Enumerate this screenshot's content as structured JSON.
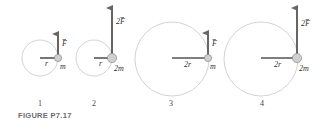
{
  "figure": {
    "caption": "FIGURE P7.17",
    "colors": {
      "circle": "#c8c8c8",
      "arrow": "#666666",
      "mass_fill": "#cfcfcf",
      "mass_stroke": "#8a8a8a",
      "radius_line": "#555555"
    },
    "panels": [
      {
        "number": "1",
        "radius_label": "r",
        "mass_label": "m",
        "force_label": "F",
        "force_prefix": ""
      },
      {
        "number": "2",
        "radius_label": "r",
        "mass_label": "2m",
        "force_label": "F",
        "force_prefix": "2"
      },
      {
        "number": "3",
        "radius_label": "2r",
        "mass_label": "m",
        "force_label": "F",
        "force_prefix": ""
      },
      {
        "number": "4",
        "radius_label": "2r",
        "mass_label": "2m",
        "force_label": "F",
        "force_prefix": "2"
      }
    ]
  }
}
